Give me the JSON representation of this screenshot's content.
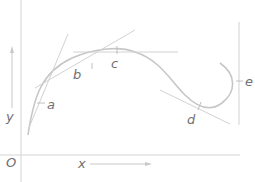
{
  "diagram": {
    "origin_label": "O",
    "x_axis_label": "x",
    "y_axis_label": "y",
    "points": [
      {
        "id": "a",
        "label": "a"
      },
      {
        "id": "b",
        "label": "b"
      },
      {
        "id": "c",
        "label": "c"
      },
      {
        "id": "d",
        "label": "d"
      },
      {
        "id": "e",
        "label": "e"
      }
    ],
    "colors": {
      "curve": "#c6c6c6",
      "tangent": "#d2d2d2",
      "axis": "#d4d4d4",
      "label": "#707070"
    }
  }
}
